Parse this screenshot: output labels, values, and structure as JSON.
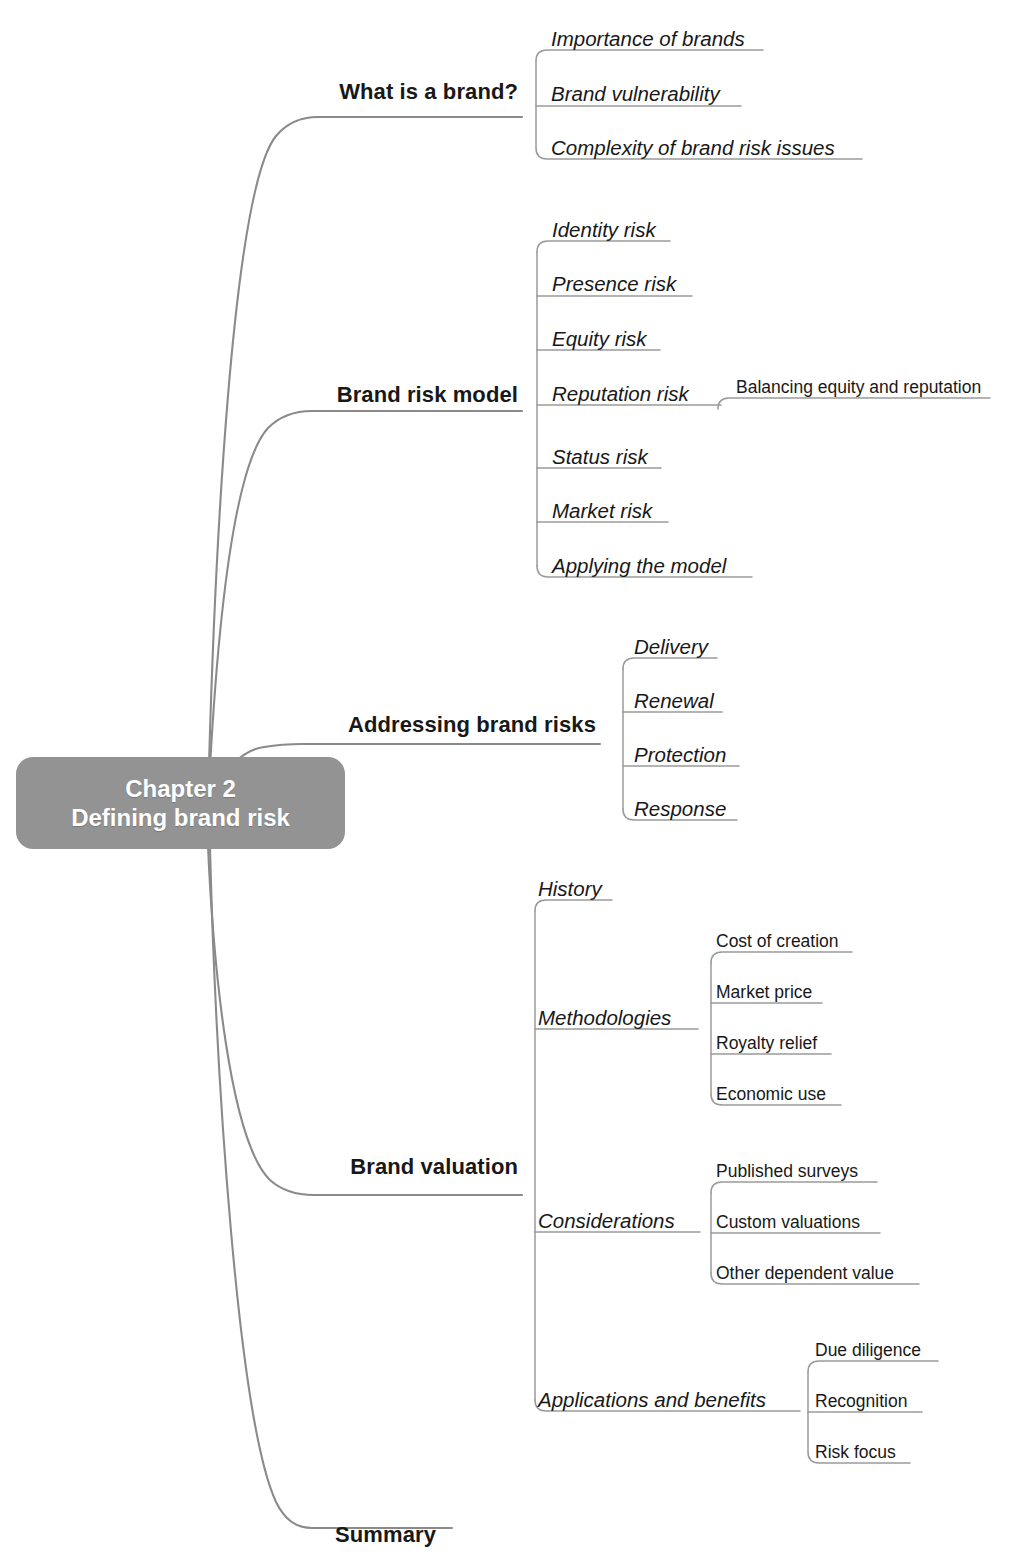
{
  "diagram": {
    "type": "mind-map",
    "colors": {
      "center_fill": "#939393",
      "center_text": "#ffffff",
      "branch_line": "#8a8a8a",
      "underline": "#9a9a9a",
      "text": "#181818",
      "background": "#ffffff"
    },
    "center": {
      "line1": "Chapter  2",
      "line2": "Defining brand risk"
    },
    "branches": [
      {
        "label": "What is a brand?",
        "children": [
          {
            "label": "Importance of brands",
            "children": []
          },
          {
            "label": "Brand vulnerability",
            "children": []
          },
          {
            "label": "Complexity of brand risk issues",
            "children": []
          }
        ]
      },
      {
        "label": "Brand risk model",
        "children": [
          {
            "label": "Identity risk",
            "children": []
          },
          {
            "label": "Presence risk",
            "children": []
          },
          {
            "label": "Equity risk",
            "children": []
          },
          {
            "label": "Reputation risk",
            "children": [
              {
                "label": "Balancing equity and reputation"
              }
            ]
          },
          {
            "label": "Status risk",
            "children": []
          },
          {
            "label": "Market risk",
            "children": []
          },
          {
            "label": "Applying the model",
            "children": []
          }
        ]
      },
      {
        "label": "Addressing brand risks",
        "children": [
          {
            "label": "Delivery",
            "children": []
          },
          {
            "label": "Renewal",
            "children": []
          },
          {
            "label": "Protection",
            "children": []
          },
          {
            "label": "Response",
            "children": []
          }
        ]
      },
      {
        "label": "Brand valuation",
        "children": [
          {
            "label": "History",
            "children": []
          },
          {
            "label": "Methodologies",
            "children": [
              {
                "label": "Cost of creation"
              },
              {
                "label": "Market price"
              },
              {
                "label": "Royalty relief"
              },
              {
                "label": "Economic use"
              }
            ]
          },
          {
            "label": "Considerations",
            "children": [
              {
                "label": "Published surveys"
              },
              {
                "label": "Custom valuations"
              },
              {
                "label": "Other dependent value"
              }
            ]
          },
          {
            "label": "Applications and benefits",
            "children": [
              {
                "label": "Due diligence"
              },
              {
                "label": "Recognition"
              },
              {
                "label": "Risk focus"
              }
            ]
          }
        ]
      },
      {
        "label": "Summary",
        "children": []
      }
    ]
  },
  "layout": {
    "center_box": {
      "x": 16,
      "y": 757,
      "w": 329,
      "h": 92
    },
    "trunk_anchor": {
      "x": 208,
      "y": 803
    },
    "b0": {
      "label_right": 518,
      "baseline": 97,
      "trunk": "M 208 803 C 214 560 232 190 276 136 C 286 124 300 117 318 117 L 522 117",
      "spine_x": 536,
      "spine_top": 46,
      "spine_bot": 152,
      "children": [
        {
          "text_x": 551,
          "baseline": 43,
          "uline_y": 50,
          "uline_end": 763
        },
        {
          "text_x": 551,
          "baseline": 98,
          "uline_y": 106,
          "uline_end": 741
        },
        {
          "text_x": 551,
          "baseline": 152,
          "uline_y": 159,
          "uline_end": 862
        }
      ]
    },
    "b1": {
      "label_right": 518,
      "baseline": 400,
      "trunk": "M 208 806 C 213 700 226 474 268 428 C 279 417 293 411 312 411 L 522 411",
      "spine_x": 537,
      "spine_top": 232,
      "spine_bot": 570,
      "children": [
        {
          "text_x": 552,
          "baseline": 234,
          "uline_y": 241,
          "uline_end": 670
        },
        {
          "text_x": 552,
          "baseline": 288,
          "uline_y": 296,
          "uline_end": 692
        },
        {
          "text_x": 552,
          "baseline": 343,
          "uline_y": 350,
          "uline_end": 660
        },
        {
          "text_x": 552,
          "baseline": 398,
          "uline_y": 405,
          "uline_end": 721
        },
        {
          "text_x": 552,
          "baseline": 461,
          "uline_y": 468,
          "uline_end": 661
        },
        {
          "text_x": 552,
          "baseline": 515,
          "uline_y": 522,
          "uline_end": 668
        },
        {
          "text_x": 552,
          "baseline": 570,
          "uline_y": 577,
          "uline_end": 752
        }
      ],
      "sub": {
        "parent_index": 3,
        "spine_x": 729,
        "spine_top": 396,
        "spine_bot": 396,
        "items": [
          {
            "text_x": 736,
            "baseline": 391,
            "uline_y": 398,
            "uline_end": 990
          }
        ]
      }
    },
    "b2": {
      "label_right": 596,
      "baseline": 730,
      "trunk": "M 212 800 C 220 776 238 751 264 747 C 276 745 288 744 302 744 L 600 744",
      "spine_x": 623,
      "spine_top": 650,
      "spine_bot": 812,
      "children": [
        {
          "text_x": 634,
          "baseline": 651,
          "uline_y": 658,
          "uline_end": 717
        },
        {
          "text_x": 634,
          "baseline": 705,
          "uline_y": 712,
          "uline_end": 722
        },
        {
          "text_x": 634,
          "baseline": 759,
          "uline_y": 766,
          "uline_end": 739
        },
        {
          "text_x": 634,
          "baseline": 813,
          "uline_y": 820,
          "uline_end": 737
        }
      ]
    },
    "b3": {
      "label_right": 518,
      "baseline": 1172,
      "trunk": "M 208 846 C 213 960 229 1140 270 1180 C 281 1190 295 1195 314 1195 L 522 1195",
      "spine_x": 535,
      "spine_top": 894,
      "spine_bot": 1381,
      "children": [
        {
          "text_x": 538,
          "baseline": 893,
          "uline_y": 900,
          "uline_end": 612
        },
        {
          "text_x": 538,
          "baseline": 1022,
          "uline_y": 1029,
          "uline_end": 698
        },
        {
          "text_x": 538,
          "baseline": 1225,
          "uline_y": 1232,
          "uline_end": 700
        },
        {
          "text_x": 538,
          "baseline": 1404,
          "uline_y": 1411,
          "uline_end": 800
        }
      ],
      "subs": [
        {
          "parent_index": 1,
          "spine_x": 711,
          "spine_top": 945,
          "spine_bot": 1097,
          "items": [
            {
              "text_x": 716,
              "baseline": 945,
              "uline_y": 952,
              "uline_end": 852
            },
            {
              "text_x": 716,
              "baseline": 996,
              "uline_y": 1003,
              "uline_end": 822
            },
            {
              "text_x": 716,
              "baseline": 1047,
              "uline_y": 1054,
              "uline_end": 831
            },
            {
              "text_x": 716,
              "baseline": 1098,
              "uline_y": 1105,
              "uline_end": 841
            }
          ]
        },
        {
          "parent_index": 2,
          "spine_x": 711,
          "spine_top": 1175,
          "spine_bot": 1277,
          "items": [
            {
              "text_x": 716,
              "baseline": 1175,
              "uline_y": 1182,
              "uline_end": 877
            },
            {
              "text_x": 716,
              "baseline": 1226,
              "uline_y": 1233,
              "uline_end": 880
            },
            {
              "text_x": 716,
              "baseline": 1277,
              "uline_y": 1284,
              "uline_end": 919
            }
          ]
        },
        {
          "parent_index": 3,
          "spine_x": 808,
          "spine_top": 1354,
          "spine_bot": 1456,
          "items": [
            {
              "text_x": 815,
              "baseline": 1354,
              "uline_y": 1361,
              "uline_end": 938
            },
            {
              "text_x": 815,
              "baseline": 1405,
              "uline_y": 1412,
              "uline_end": 922
            },
            {
              "text_x": 815,
              "baseline": 1456,
              "uline_y": 1463,
              "uline_end": 910
            }
          ]
        }
      ]
    },
    "b4": {
      "label_right": 436,
      "baseline": 1540,
      "trunk": "M 210 848 C 216 1080 238 1420 276 1502 C 285 1520 296 1528 312 1528 L 452 1528"
    }
  }
}
